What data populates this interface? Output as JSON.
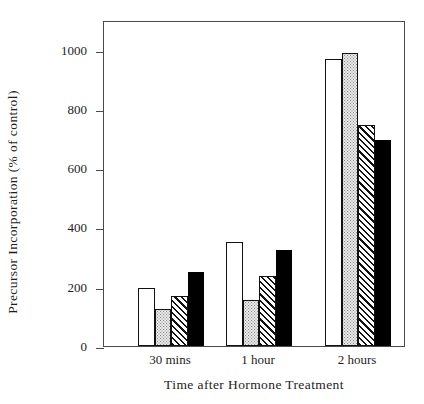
{
  "chart_data": {
    "type": "bar",
    "title": "",
    "xlabel": "Time after Hormone Treatment",
    "ylabel": "Precursor Incorporation (% of control)",
    "categories": [
      "30 mins",
      "1 hour",
      "2 hours"
    ],
    "yticks": [
      0,
      200,
      400,
      600,
      800,
      1000
    ],
    "ytick_labels": [
      "0",
      "200",
      "400",
      "600",
      "800",
      "1000"
    ],
    "ylim": [
      0,
      1100
    ],
    "grid": false,
    "legend": "none",
    "series": [
      {
        "name": "series-1",
        "fill": "white",
        "values": [
          195,
          350,
          970
        ]
      },
      {
        "name": "series-2",
        "fill": "stippled",
        "values": [
          125,
          155,
          990
        ]
      },
      {
        "name": "series-3",
        "fill": "hatched",
        "values": [
          170,
          235,
          745
        ]
      },
      {
        "name": "series-4",
        "fill": "black",
        "values": [
          250,
          325,
          695
        ]
      }
    ]
  },
  "colors": {
    "axis": "#4a4a4a",
    "bar_outline": "#111111",
    "solid_fill": "#000000",
    "stipple_fill": "#e9e9e9",
    "background": "#ffffff"
  }
}
